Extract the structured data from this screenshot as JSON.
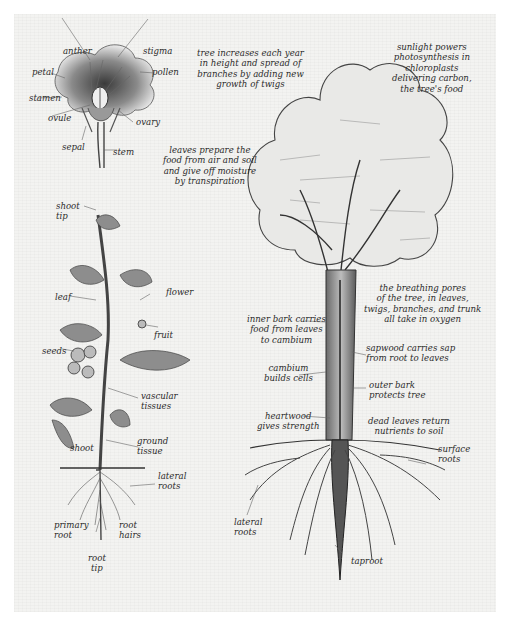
{
  "figure": {
    "type": "botanical-illustration",
    "subjects": [
      "flower cross-section",
      "tomato plant",
      "tree"
    ]
  },
  "flower": {
    "labels": {
      "anther": "anther",
      "stigma": "stigma",
      "petal": "petal",
      "pollen": "pollen",
      "stamen": "stamen",
      "ovule": "ovule",
      "ovary": "ovary",
      "sepal": "sepal",
      "stem": "stem"
    }
  },
  "tomato_plant": {
    "labels": {
      "shoot_tip": "shoot\ntip",
      "leaf": "leaf",
      "flower": "flower",
      "fruit": "fruit",
      "seeds": "seeds",
      "vascular_tissues": "vascular\ntissues",
      "shoot": "shoot",
      "ground_tissue": "ground\ntissue",
      "lateral_roots": "lateral\nroots",
      "primary_root": "primary\nroot",
      "root_hairs": "root\nhairs",
      "root_tip": "root\ntip"
    }
  },
  "tree": {
    "annotations": {
      "growth": "tree increases each year\nin height and spread of\nbranches by adding new\ngrowth of twigs",
      "sunlight": "sunlight powers\nphotosynthesis in\nchloroplasts\ndelivering carbon,\nthe tree's food",
      "leaves": "leaves prepare the\nfood from air and soil\nand give off moisture\nby transpiration",
      "breathing_pores": "the breathing pores\nof the tree, in leaves,\ntwigs, branches, and trunk\nall take in oxygen",
      "inner_bark": "inner bark carries\nfood from leaves\nto cambium",
      "sapwood": "sapwood carries sap\nfrom root to leaves",
      "cambium": "cambium\nbuilds cells",
      "outer_bark": "outer bark\nprotects tree",
      "heartwood": "heartwood\ngives strength",
      "dead_leaves": "dead leaves return\nnutrients to soil",
      "surface_roots": "surface\nroots",
      "lateral_roots": "lateral\nroots",
      "taproot": "taproot"
    }
  },
  "colors": {
    "paper": "#f3f3f1",
    "ink": "#2b2b2b",
    "page_bg": "#ffffff"
  }
}
